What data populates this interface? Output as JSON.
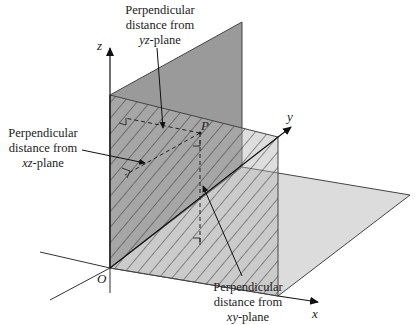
{
  "diagram": {
    "axes": {
      "x_label": "x",
      "y_label": "y",
      "z_label": "z",
      "origin_label": "O"
    },
    "point": {
      "label": "P"
    },
    "planes": {
      "yz": {
        "name": "yz-plane",
        "fill": "#9a9a9a"
      },
      "xz": {
        "name": "xz-plane",
        "fill": "#b0b0b0",
        "pattern": "diagonal-hatch"
      },
      "xy": {
        "name": "xy-plane",
        "fill": "#dcdcdc"
      }
    },
    "annotations": [
      {
        "id": "yz",
        "line1": "Perpendicular",
        "line2": "distance from",
        "line3_italic": "yz",
        "line3_rest": "-plane"
      },
      {
        "id": "xz",
        "line1": "Perpendicular",
        "line2": "distance from",
        "line3_italic": "xz",
        "line3_rest": "-plane"
      },
      {
        "id": "xy",
        "line1": "Perpendicular",
        "line2": "distance from",
        "line3_italic": "xy",
        "line3_rest": "-plane"
      }
    ]
  }
}
